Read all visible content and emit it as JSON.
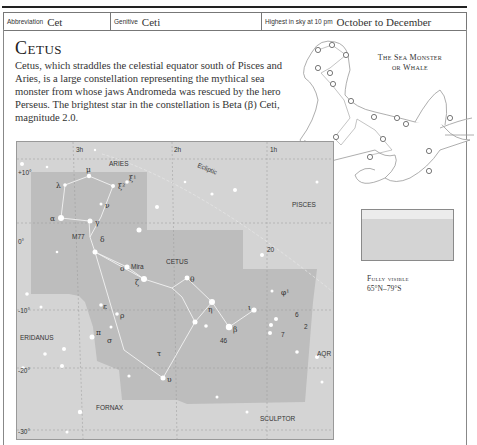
{
  "header": {
    "abbreviation_label": "Abbreviation",
    "abbreviation": "Cet",
    "genitive_label": "Genitive",
    "genitive": "Ceti",
    "highest_label": "Highest in sky at 10 pm",
    "highest": "October to December"
  },
  "title": "Cetus",
  "description": "Cetus, which straddles the celestial equator south of Pisces and Aries, is a large constellation representing the mythical sea monster from whose jaws Andromeda was rescued by the hero Perseus. The brightest star in the constellation is Beta (β) Ceti, magnitude 2.0.",
  "illustration": {
    "label_line1": "The Sea Monster",
    "label_line2": "or Whale"
  },
  "visibility": {
    "label": "Fully visible",
    "range": "65°N–79°S"
  },
  "map": {
    "ra_ticks": [
      "3h",
      "2h",
      "1h"
    ],
    "dec_ticks": [
      "+10°",
      "0°",
      "-10°",
      "-20°",
      "-30°"
    ],
    "ecliptic_label": "Ecliptic",
    "constellations": [
      "ARIES",
      "PISCES",
      "CETUS",
      "ERIDANUS",
      "FORNAX",
      "SCULPTOR",
      "AQR"
    ],
    "stars": [
      "λ",
      "μ",
      "ξ²",
      "ξ¹",
      "ν",
      "α",
      "γ",
      "δ",
      "M77",
      "ο",
      "Mira",
      "20",
      "θ",
      "ζ",
      "η",
      "φ¹",
      "ι",
      "ε",
      "ρ",
      "π",
      "σ",
      "τ",
      "46",
      "β",
      "υ",
      "6",
      "2",
      "7"
    ]
  }
}
